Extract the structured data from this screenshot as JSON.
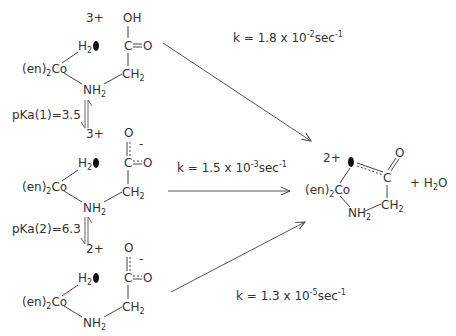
{
  "diagram": {
    "reactants": [
      {
        "charge": "3+",
        "metal": "(en)",
        "metal_sub": "2",
        "metal_atom": "Co",
        "water": "H",
        "water_sub": "2",
        "carbonyl_top": "OH",
        "carbon": "C",
        "carbonyl_right": "O",
        "ch2": "CH",
        "ch2_sub": "2",
        "nh2": "NH",
        "nh2_sub": "2",
        "carboxyl_charge": ""
      },
      {
        "charge": "3+",
        "metal": "(en)",
        "metal_sub": "2",
        "metal_atom": "Co",
        "water": "H",
        "water_sub": "2",
        "carbonyl_top": "O",
        "carbon": "C",
        "carbonyl_right": "O",
        "ch2": "CH",
        "ch2_sub": "2",
        "nh2": "NH",
        "nh2_sub": "2",
        "carboxyl_charge": "-"
      },
      {
        "charge": "2+",
        "metal": "(en)",
        "metal_sub": "2",
        "metal_atom": "Co",
        "water": "H",
        "water_sub": "2",
        "carbonyl_top": "O",
        "carbon": "C",
        "carbonyl_right": "O",
        "ch2": "CH",
        "ch2_sub": "2",
        "nh2": "NH",
        "nh2_sub": "2",
        "carboxyl_charge": "-"
      }
    ],
    "equilibria": [
      {
        "label": "pKa(1)=3.5"
      },
      {
        "label": "pKa(2)=6.3"
      }
    ],
    "rate_constants": [
      {
        "prefix": "k = 1.8 x 10",
        "exp": "-2",
        "unit": "sec",
        "unit_exp": "-1"
      },
      {
        "prefix": "k = 1.5 x 10",
        "exp": "-3",
        "unit": "sec",
        "unit_exp": "-1"
      },
      {
        "prefix": "k = 1.3 x 10",
        "exp": "-5",
        "unit": "sec",
        "unit_exp": "-1"
      }
    ],
    "product": {
      "charge": "2+",
      "metal": "(en)",
      "metal_sub": "2",
      "metal_atom": "Co",
      "carbon": "C",
      "oxo": "O",
      "ch2": "CH",
      "ch2_sub": "2",
      "nh2": "NH",
      "nh2_sub": "2",
      "byproduct_prefix": "+ H",
      "byproduct_sub": "2",
      "byproduct_suffix": "O"
    }
  }
}
